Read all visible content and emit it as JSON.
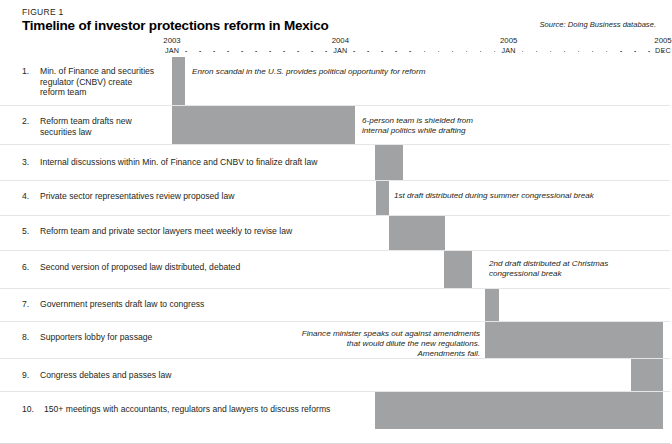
{
  "figure": {
    "label": "FIGURE 1",
    "title": "Timeline of investor protections reform in Mexico",
    "source": "Source: Doing Business database."
  },
  "chart_data": {
    "type": "bar",
    "subtype": "gantt-timeline",
    "title": "Timeline of investor protections reform in Mexico",
    "xlabel": "",
    "ylabel": "",
    "grid": false,
    "legend": "none",
    "axis": {
      "unit": "month",
      "x_start_px": 172,
      "x_end_px": 663,
      "months_total": 36,
      "year_labels": [
        {
          "year": "2003",
          "month": "JAN",
          "month_index": 0
        },
        {
          "year": "2004",
          "month": "JAN",
          "month_index": 12
        },
        {
          "year": "2005",
          "month": "JAN",
          "month_index": 24
        },
        {
          "year": "2005",
          "month": "DEC",
          "month_index": 35
        }
      ],
      "tick_count": 36
    },
    "categories": [
      "1. Min. of Finance and securities regulator (CNBV) create reform team",
      "2. Reform team drafts new securities law",
      "3. Internal discussions within Min. of Finance and CNBV to finalize draft law",
      "4. Private sector representatives review proposed law",
      "5. Reform team and private sector lawyers meet weekly to revise law",
      "6. Second version of proposed law distributed, debated",
      "7. Government presents draft law to congress",
      "8. Supporters lobby for passage",
      "9. Congress debates and passes law",
      "10. 150+ meetings with accountants, regulators and lawyers to discuss reforms"
    ],
    "bars_start_month": [
      0,
      0,
      15,
      17,
      19,
      21,
      23,
      23,
      33,
      14
    ],
    "bars_end_month": [
      1,
      13,
      17,
      19,
      21,
      23,
      24,
      36,
      36,
      36
    ]
  },
  "rows": [
    {
      "num": "1.",
      "text": "Min. of Finance and securities\nregulator (CNBV) create\nreform team",
      "note": "Enron scandal in the U.S. provides political opportunity for reform",
      "bar": {
        "left": 172,
        "width": 13
      }
    },
    {
      "num": "2.",
      "text": "Reform team drafts new\nsecurities law",
      "note": "6-person team is shielded from\ninternal politics while drafting",
      "bar": {
        "left": 172,
        "width": 183
      }
    },
    {
      "num": "3.",
      "text": "Internal discussions within Min. of Finance and CNBV to finalize draft law",
      "note": "",
      "bar": {
        "left": 375,
        "width": 28
      }
    },
    {
      "num": "4.",
      "text": "Private sector representatives review proposed law",
      "note": "1st draft distributed during summer congressional break",
      "bar": {
        "left": 376,
        "width": 13
      }
    },
    {
      "num": "5.",
      "text": "Reform team and private sector lawyers meet weekly to revise law",
      "note": "",
      "bar": {
        "left": 389,
        "width": 56
      }
    },
    {
      "num": "6.",
      "text": "Second version of proposed law distributed, debated",
      "note": "2nd draft distributed at Christmas\ncongressional break",
      "bar": {
        "left": 444,
        "width": 28
      }
    },
    {
      "num": "7.",
      "text": "Government presents draft law to congress",
      "note": "",
      "bar": {
        "left": 485,
        "width": 14
      }
    },
    {
      "num": "8.",
      "text": "Supporters lobby for passage",
      "note": "Finance minister speaks out against amendments\nthat would dilute the new regulations.\nAmendments fail.",
      "bar": {
        "left": 485,
        "width": 178
      }
    },
    {
      "num": "9.",
      "text": "Congress debates and passes law",
      "note": "",
      "bar": {
        "left": 631,
        "width": 32
      }
    },
    {
      "num": "10.",
      "text": "150+ meetings with accountants, regulators and lawyers to discuss reforms",
      "note": "",
      "bar": {
        "left": 375,
        "width": 288
      }
    }
  ],
  "colors": {
    "bar": "#a0a2a4",
    "text": "#231f20",
    "rule": "#e6e6e6",
    "background": "#ffffff"
  }
}
